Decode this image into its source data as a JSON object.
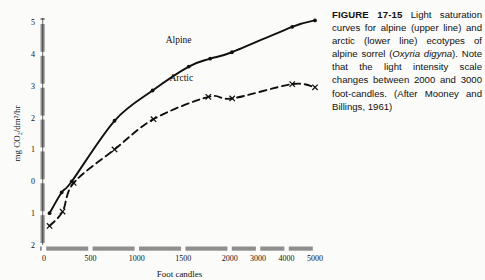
{
  "figure": {
    "caption_label": "FIGURE 17-15",
    "caption_body_1": " Light saturation curves for alpine (upper line) and arctic (lower line) ecotypes of alpine sorrel (",
    "caption_species": "Oxyria digyna",
    "caption_body_2": "). Note that the light intensity scale changes between 2000 and 3000 foot-candles. (After Mooney and Billings, 1961)"
  },
  "chart_data": {
    "type": "line",
    "title": "",
    "xlabel": "Foot candles",
    "ylabel": "mg CO₂/dm²/hr",
    "xticks": [
      0,
      500,
      1000,
      1500,
      2000,
      3000,
      4000,
      5000
    ],
    "xtick_labels": [
      "0",
      "500",
      "1000",
      "1500",
      "2000",
      "3000",
      "4000",
      "5000"
    ],
    "yticks": [
      5,
      4,
      3,
      2,
      1,
      0,
      -1,
      -2
    ],
    "ytick_labels": [
      "5",
      "4",
      "3",
      "2",
      "1",
      "0",
      "1",
      "2"
    ],
    "xlim": [
      0,
      5000
    ],
    "ylim": [
      -2,
      5
    ],
    "grid": false,
    "axis_scale_break_note": "x axis scale changes between 2000 and 3000",
    "legend_position": "inline-annotations",
    "series": [
      {
        "name": "Alpine",
        "marker": "filled-circle",
        "line_style": "solid",
        "label_x": 1450,
        "label_y": 4.35,
        "points": [
          {
            "x": 60,
            "y": -1.0
          },
          {
            "x": 190,
            "y": -0.35
          },
          {
            "x": 300,
            "y": 0.0
          },
          {
            "x": 760,
            "y": 1.9
          },
          {
            "x": 1170,
            "y": 2.85
          },
          {
            "x": 1560,
            "y": 3.6
          },
          {
            "x": 1790,
            "y": 3.85
          },
          {
            "x": 2080,
            "y": 4.05
          },
          {
            "x": 4200,
            "y": 4.85
          },
          {
            "x": 5000,
            "y": 5.05
          }
        ]
      },
      {
        "name": "Arctic",
        "marker": "x-cross",
        "line_style": "dashed",
        "label_x": 1480,
        "label_y": 3.15,
        "points": [
          {
            "x": 60,
            "y": -1.4
          },
          {
            "x": 200,
            "y": -0.95
          },
          {
            "x": 320,
            "y": -0.05
          },
          {
            "x": 760,
            "y": 1.0
          },
          {
            "x": 1180,
            "y": 1.95
          },
          {
            "x": 1770,
            "y": 2.65
          },
          {
            "x": 2090,
            "y": 2.6
          },
          {
            "x": 4200,
            "y": 3.05
          },
          {
            "x": 5000,
            "y": 2.95
          }
        ]
      }
    ]
  },
  "colors": {
    "axis": "#8f8f8f",
    "curve": "#101010",
    "text": "#14110f",
    "page_background": "#fbfbf9"
  }
}
